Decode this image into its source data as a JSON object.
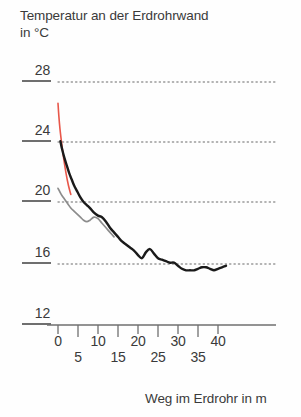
{
  "chart_data": {
    "type": "line",
    "title": "Temperatur an der Erdrohrwand\nin °C",
    "title_line1": "Temperatur an der Erdrohrwand",
    "title_line2": "in °C",
    "xlabel": "Weg im Erdrohr in m",
    "ylabel": "Temperatur an der Erdrohrwand in °C",
    "xlim": [
      0,
      43
    ],
    "ylim": [
      12,
      28
    ],
    "grid": true,
    "grid_style": "dotted",
    "grid_values": [
      28,
      24,
      20,
      16
    ],
    "legend": "none",
    "ytick_labels": [
      "28",
      "24",
      "20",
      "16",
      "12"
    ],
    "yticks": [
      28,
      24,
      20,
      16,
      12
    ],
    "xtick_labels": [
      "0",
      "5",
      "10",
      "15",
      "20",
      "25",
      "30",
      "35",
      "40"
    ],
    "xticks": [
      0,
      5,
      10,
      15,
      20,
      25,
      30,
      35,
      40
    ],
    "colors": {
      "series_inlet": "#e8574a",
      "series_main": "#1a1a1a",
      "series_secondary": "#8c8c8c",
      "axis": "#6f6f6f",
      "grid": "#9a9a9a",
      "text": "#3a3a3a"
    },
    "series": [
      {
        "name": "Einlasstemperatur",
        "color": "#e8574a",
        "x": [
          0.0,
          0.2,
          0.5,
          0.9,
          1.4,
          2.0,
          2.6,
          3.2
        ],
        "values": [
          26.6,
          25.8,
          24.9,
          24.0,
          23.0,
          22.0,
          21.2,
          20.6
        ]
      },
      {
        "name": "Rohrwandtemperatur",
        "color": "#1a1a1a",
        "x": [
          0.6,
          1.0,
          1.6,
          2.2,
          2.8,
          3.4,
          4.0,
          4.8,
          5.6,
          6.4,
          7.2,
          8.0,
          9.0,
          10.0,
          11.0,
          12.0,
          13.0,
          14.0,
          15.0,
          16.0,
          17.0,
          18.0,
          19.0,
          20.0,
          21.0,
          22.0,
          23.0,
          24.0,
          25.0,
          26.0,
          27.0,
          28.0,
          29.0,
          30.0,
          31.0,
          32.0,
          33.0,
          34.0,
          35.0,
          36.0,
          37.0,
          38.0,
          39.0,
          40.0,
          41.0,
          42.0
        ],
        "values": [
          24.1,
          23.6,
          23.0,
          22.5,
          22.0,
          21.6,
          21.2,
          20.8,
          20.4,
          20.1,
          19.9,
          19.7,
          19.4,
          19.2,
          19.1,
          18.8,
          18.4,
          18.1,
          17.8,
          17.5,
          17.3,
          17.1,
          16.9,
          16.6,
          16.4,
          16.8,
          17.0,
          16.7,
          16.4,
          16.3,
          16.2,
          16.1,
          16.1,
          15.9,
          15.7,
          15.6,
          15.6,
          15.6,
          15.7,
          15.8,
          15.8,
          15.7,
          15.6,
          15.7,
          15.8,
          15.9
        ]
      },
      {
        "name": "Erdreichtemperatur",
        "color": "#8c8c8c",
        "x": [
          0.0,
          0.8,
          1.6,
          2.4,
          3.2,
          4.0,
          4.8,
          5.6,
          6.4,
          7.2,
          8.0,
          9.0,
          10.0,
          11.0,
          12.0,
          13.0,
          14.0
        ],
        "values": [
          21.0,
          20.6,
          20.3,
          20.0,
          19.7,
          19.5,
          19.3,
          19.1,
          18.9,
          18.8,
          18.9,
          19.1,
          19.0,
          18.7,
          18.4,
          18.1,
          17.8
        ]
      }
    ]
  }
}
